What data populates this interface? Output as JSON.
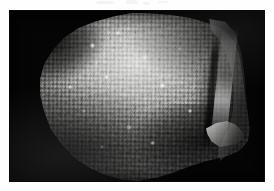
{
  "figure": {
    "kind": "photographic-plate",
    "caption": "",
    "subject_description": "Grayscale photograph of a rounded specimen with a densely granular, tuberculate surface, lit from the upper left, mounted on a plain black background.",
    "background_color": "#050505",
    "page_color": "#fefefe",
    "plate": {
      "x": 10,
      "y": 11,
      "width": 254,
      "height": 170
    },
    "specimen": {
      "name": "granular-specimen",
      "outline": "irregular rounded, broader at top, tapering to lower left",
      "surface_texture": "densely packed rounded granules / tubercles",
      "lighting": "upper-left illumination, shadowed lower-right",
      "features": [
        {
          "name": "eroded-shoulder-upper-left",
          "tone": "dark"
        },
        {
          "name": "bright-calcitic-rim-right",
          "tone": "bright"
        },
        {
          "name": "deep-fissure-right-margin",
          "tone": "dark"
        },
        {
          "name": "broken-spur-lower-right",
          "tone": "bright"
        },
        {
          "name": "shadowed-flank-lower-right",
          "tone": "dark"
        }
      ],
      "tone_range": {
        "highlight": "#dcdcda",
        "midtone": "#8f8f8d",
        "shadow": "#1a1a19"
      }
    },
    "scan_artifacts": "faint gray speckles along the upper page margin"
  }
}
